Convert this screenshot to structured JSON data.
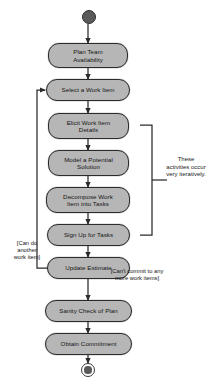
{
  "diagram": {
    "type": "uml-activity-diagram",
    "background_color": "#ffffff",
    "node_fill_color": "#b6b6b6",
    "node_border_color": "#2b2b2b",
    "edge_color": "#2b2b2b",
    "initial_node": {
      "name": "initial-node",
      "shape": "filled-circle"
    },
    "final_node": {
      "name": "final-node",
      "shape": "circle-in-ring"
    },
    "activities": [
      {
        "id": "plan-team-availability",
        "label": "Plan Team\nAvailability"
      },
      {
        "id": "select-a-work-item",
        "label": "Select a Work Item"
      },
      {
        "id": "elicit-work-item-details",
        "label": "Elicit Work Item\nDetails"
      },
      {
        "id": "model-a-potential-solution",
        "label": "Model a Potential\nSolution"
      },
      {
        "id": "decompose-work-item-into-tasks",
        "label": "Decompose Work\nItem into Tasks"
      },
      {
        "id": "sign-up-for-tasks",
        "label": "Sign Up for Tasks"
      },
      {
        "id": "update-estimate",
        "label": "Update Estimate"
      },
      {
        "id": "sanity-check-of-plan",
        "label": "Sanity Check of Plan"
      },
      {
        "id": "obtain-commitment",
        "label": "Obtain Commitment"
      }
    ],
    "guards": {
      "loop_back": "[Can do\nanother\nwork item]",
      "exit_loop": "[Can't commit to any\nmore work items]"
    },
    "annotation": {
      "bracket_note": "These\nactivities occur\nvery iteratively.",
      "bracket_spans": [
        "elicit-work-item-details",
        "sign-up-for-tasks"
      ]
    }
  }
}
